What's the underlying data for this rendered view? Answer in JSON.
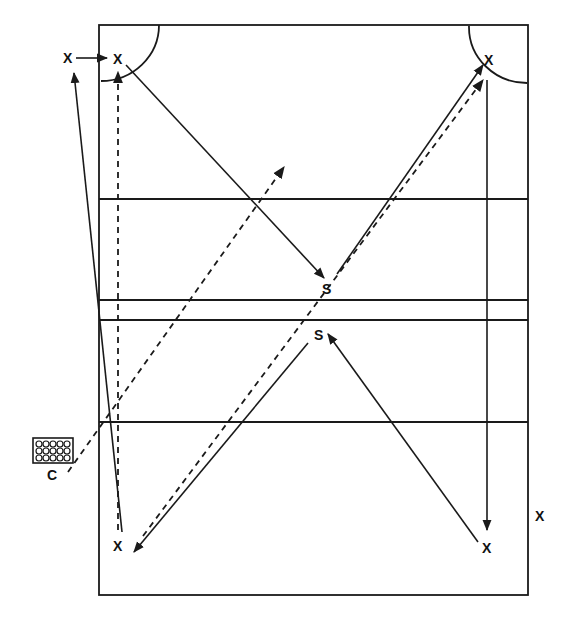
{
  "diagram": {
    "type": "volleyball-drill",
    "colors": {
      "ink": "#1a1a1a",
      "background": "#ffffff"
    },
    "court": {
      "outer": {
        "x": 99,
        "y": 25,
        "w": 429,
        "h": 570
      },
      "lines_y": [
        199,
        300,
        320,
        422
      ],
      "right_inner_line_x": 487,
      "corner_arcs": [
        "top-left",
        "top-right"
      ]
    },
    "labels": {
      "player_top_left_outside": "X",
      "player_top_left": "X",
      "player_top_right": "X",
      "setter_upper": "S",
      "setter_lower": "S",
      "player_bottom_left": "X",
      "player_bottom_right": "X",
      "player_outside_right": "X",
      "coach": "C"
    },
    "ball_cart": {
      "label": "ball-cart-icon",
      "balls": 15
    },
    "paths": [
      {
        "name": "x-outside-to-x-top-left",
        "style": "solid",
        "from": "X top-left outside",
        "to": "X top-left"
      },
      {
        "name": "x-top-left-to-setter",
        "style": "solid",
        "from": "X top-left",
        "to": "S upper"
      },
      {
        "name": "setter-upper-to-x-top-right",
        "style": "solid",
        "from": "S upper",
        "to": "X top-right"
      },
      {
        "name": "x-bottom-right-to-setter-lower",
        "style": "solid",
        "from": "X bottom-right",
        "to": "S lower"
      },
      {
        "name": "x-top-right-down-right-line",
        "style": "solid",
        "from": "X top-right",
        "to": "X bottom-right"
      },
      {
        "name": "setter-lower-to-x-bottom-left",
        "style": "solid",
        "from": "S lower",
        "to": "X bottom-left"
      },
      {
        "name": "x-bottom-left-to-x-outside",
        "style": "solid",
        "from": "X bottom-left",
        "to": "X top-left outside"
      },
      {
        "name": "coach-ball-dashed",
        "style": "dashed",
        "from": "C",
        "to": "mid-court"
      },
      {
        "name": "bottom-left-to-top-left-dashed",
        "style": "dashed",
        "from": "X bottom-left",
        "to": "X top-left"
      },
      {
        "name": "bottom-left-to-top-right-dashed",
        "style": "dashed",
        "from": "X bottom-left",
        "to": "X top-right"
      }
    ]
  }
}
